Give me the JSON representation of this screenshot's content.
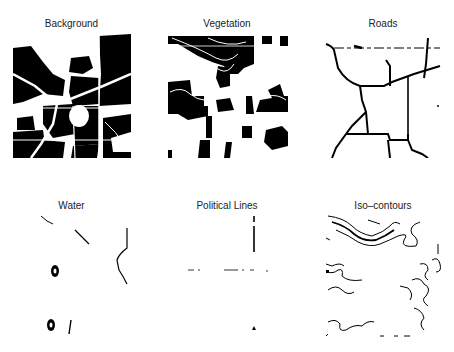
{
  "figure": {
    "panels": [
      {
        "id": "background",
        "title": "Background"
      },
      {
        "id": "vegetation",
        "title": "Vegetation"
      },
      {
        "id": "roads",
        "title": "Roads"
      },
      {
        "id": "water",
        "title": "Water"
      },
      {
        "id": "political",
        "title": "Political Lines"
      },
      {
        "id": "contours",
        "title": "Iso–contours"
      }
    ],
    "colors": {
      "ink": "#000000",
      "paper": "#ffffff",
      "title": "#222222"
    }
  }
}
